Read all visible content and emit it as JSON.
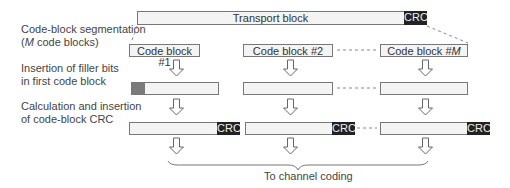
{
  "labels": {
    "segmentation_line1": "Code-block segmentation",
    "segmentation_line2_italic": "M",
    "segmentation_line2_rest": " code blocks)",
    "segmentation_line2_prefix": "(",
    "filler_line1": "Insertion of filler bits",
    "filler_line2": "in first code block",
    "crc_line1": "Calculation and insertion",
    "crc_line2": "of code-block CRC",
    "output": "To channel coding"
  },
  "transport_block": {
    "label": "Transport block",
    "crc": "CRC"
  },
  "code_blocks": [
    {
      "label": "Code block #1",
      "crc": "CRC"
    },
    {
      "label": "Code block #2",
      "crc": "CRC"
    },
    {
      "label_prefix": "Code block #",
      "label_italic": "M",
      "crc": "CRC"
    }
  ],
  "colors": {
    "crc_fill": "#222222",
    "filler_fill": "#7a7a7a",
    "block_fill": "#f4f4f4",
    "outline": "#777777"
  }
}
